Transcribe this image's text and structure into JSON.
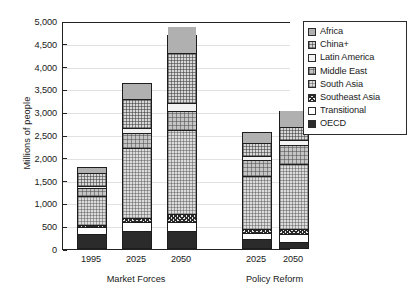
{
  "chart_data": {
    "type": "bar",
    "subtype": "stacked",
    "title": "",
    "xlabel": "",
    "ylabel": "Millions of people",
    "ylim": [
      0,
      5000
    ],
    "ytick_values": [
      0,
      500,
      1000,
      1500,
      2000,
      2500,
      3000,
      3500,
      4000,
      4500,
      5000
    ],
    "ytick_labels": [
      "0",
      "500",
      "1,000",
      "1,500",
      "2,000",
      "2,500",
      "3,000",
      "3,500",
      "4,000",
      "4,500",
      "5,000"
    ],
    "grid": true,
    "legend_position": "right-outside",
    "groups": [
      {
        "name": "Market Forces",
        "categories": [
          "1995",
          "2025",
          "2050"
        ]
      },
      {
        "name": "Policy Reform",
        "categories": [
          "2025",
          "2050"
        ]
      }
    ],
    "categories": [
      "1995",
      "2025",
      "2050",
      "2025",
      "2050"
    ],
    "stack_order_bottom_to_top": [
      "OECD",
      "Transitional",
      "Southeast Asia",
      "South Asia",
      "Middle East",
      "Latin America",
      "China+",
      "Africa"
    ],
    "series": [
      {
        "name": "OECD",
        "pattern": "solid-black",
        "values": [
          290,
          355,
          350,
          190,
          105
        ]
      },
      {
        "name": "Transitional",
        "pattern": "white",
        "values": [
          155,
          190,
          200,
          125,
          175
        ]
      },
      {
        "name": "Southeast Asia",
        "pattern": "dark-checker",
        "values": [
          40,
          105,
          170,
          90,
          130
        ]
      },
      {
        "name": "South Asia",
        "pattern": "light-checker",
        "values": [
          665,
          1545,
          1860,
          1190,
          1430
        ]
      },
      {
        "name": "Middle East",
        "pattern": "mid-checker",
        "values": [
          175,
          345,
          425,
          345,
          425
        ]
      },
      {
        "name": "Latin America",
        "pattern": "white-plain",
        "values": [
          45,
          100,
          190,
          90,
          120
        ]
      },
      {
        "name": "China+",
        "pattern": "fine-checker",
        "values": [
          290,
          640,
          1105,
          290,
          285
        ]
      },
      {
        "name": "Africa",
        "pattern": "solid-gray",
        "values": [
          140,
          370,
          585,
          255,
          375
        ]
      }
    ],
    "bar_totals": [
      1800,
      3650,
      4685,
      2575,
      3025
    ],
    "annotations": []
  },
  "legend": {
    "items": [
      {
        "label": "Africa",
        "swatch": "solid-gray"
      },
      {
        "label": "China+",
        "swatch": "fine-checker"
      },
      {
        "label": "Latin America",
        "swatch": "white-plain"
      },
      {
        "label": "Middle East",
        "swatch": "mid-checker"
      },
      {
        "label": "South Asia",
        "swatch": "light-checker"
      },
      {
        "label": "Southeast Asia",
        "swatch": "dark-checker"
      },
      {
        "label": "Transitional",
        "swatch": "white"
      },
      {
        "label": "OECD",
        "swatch": "solid-black"
      }
    ]
  },
  "colors": {
    "axis": "#222222",
    "grid": "#c9c9c9",
    "oecd": "#2b2b2b",
    "africa": "#b0b0b0",
    "background": "#ffffff"
  }
}
